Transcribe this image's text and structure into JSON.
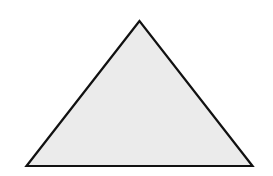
{
  "figure": {
    "shape": "triangle",
    "type": "isosceles-triangle",
    "vertices": [
      [
        139.5,
        21
      ],
      [
        26.5,
        166
      ],
      [
        252.5,
        166
      ]
    ],
    "fill": "#ebebeb",
    "stroke": "#111111",
    "stroke_width": 2.2
  },
  "background": "#ffffff"
}
